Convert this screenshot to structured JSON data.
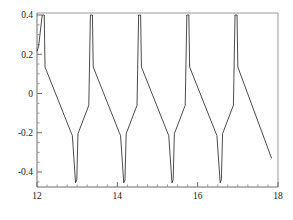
{
  "chart_data": {
    "type": "line",
    "title": "",
    "subtitle": "",
    "xlabel": "",
    "ylabel": "",
    "xlim": [
      12,
      18
    ],
    "ylim": [
      -0.48,
      0.43
    ],
    "grid": false,
    "legend": null,
    "x_ticks": [
      12,
      14,
      16,
      18
    ],
    "x_tick_labels": [
      "12",
      "14",
      "16",
      "18"
    ],
    "x_minor_tick_step": 0.25,
    "y_ticks": [
      0.4,
      0.2,
      0,
      -0.2,
      -0.4
    ],
    "y_tick_labels": [
      "0.4",
      "0.2",
      "0",
      "-0.2",
      "-0.4"
    ],
    "y_minor_tick_step": 0.05,
    "line_color": "#2b2b2b",
    "frame_color": "#9a9a9a",
    "axis_color": "#6d6d6d",
    "background_color": "#ffffff",
    "series": [
      {
        "name": "waveform",
        "description": "periodic sawtooth-like oscillation, period 1.2, peaks at 0.40, troughs at -0.45",
        "points": [
          [
            12.0,
            0.215
          ],
          [
            12.04,
            0.24
          ],
          [
            12.13,
            0.4
          ],
          [
            12.18,
            0.4
          ],
          [
            12.2,
            0.135
          ],
          [
            12.86,
            -0.205
          ],
          [
            12.88,
            -0.215
          ],
          [
            12.96,
            -0.455
          ],
          [
            12.99,
            -0.44
          ],
          [
            13.02,
            -0.205
          ],
          [
            13.29,
            -0.06
          ],
          [
            13.33,
            0.4
          ],
          [
            13.38,
            0.4
          ],
          [
            13.4,
            0.135
          ],
          [
            14.06,
            -0.205
          ],
          [
            14.08,
            -0.215
          ],
          [
            14.16,
            -0.455
          ],
          [
            14.19,
            -0.44
          ],
          [
            14.22,
            -0.205
          ],
          [
            14.49,
            -0.06
          ],
          [
            14.53,
            0.4
          ],
          [
            14.58,
            0.4
          ],
          [
            14.6,
            0.135
          ],
          [
            15.26,
            -0.205
          ],
          [
            15.28,
            -0.215
          ],
          [
            15.36,
            -0.455
          ],
          [
            15.39,
            -0.44
          ],
          [
            15.42,
            -0.205
          ],
          [
            15.69,
            -0.06
          ],
          [
            15.73,
            0.4
          ],
          [
            15.78,
            0.4
          ],
          [
            15.8,
            0.135
          ],
          [
            16.46,
            -0.205
          ],
          [
            16.48,
            -0.215
          ],
          [
            16.56,
            -0.455
          ],
          [
            16.59,
            -0.44
          ],
          [
            16.62,
            -0.205
          ],
          [
            16.89,
            -0.06
          ],
          [
            16.93,
            0.4
          ],
          [
            16.98,
            0.4
          ],
          [
            17.0,
            0.135
          ],
          [
            17.84,
            -0.33
          ]
        ]
      }
    ]
  },
  "plot_geometry": {
    "left": 37,
    "right": 278,
    "top": 13,
    "bottom": 187
  }
}
